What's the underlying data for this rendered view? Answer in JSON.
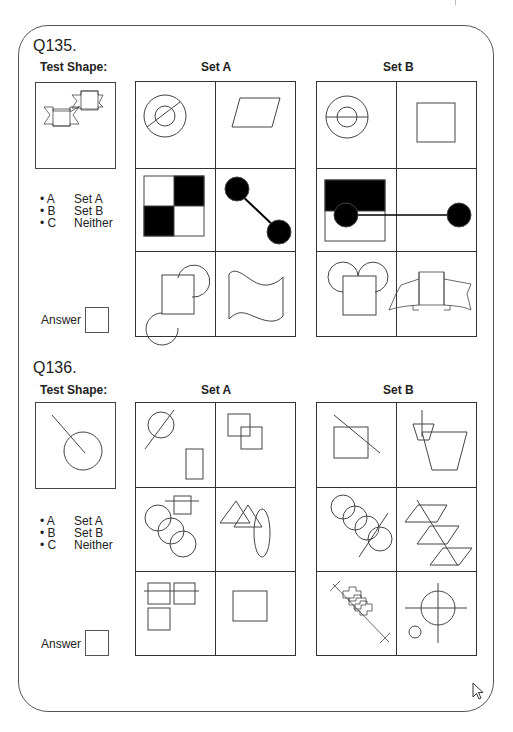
{
  "questions": [
    {
      "id": "Q135.",
      "test_shape_label": "Test Shape:",
      "set_a_label": "Set A",
      "set_b_label": "Set B",
      "test_shape": "two overlapping banner ribbons",
      "set_a_cells": [
        "concentric circles with diagonal line",
        "parallelogram",
        "checkerboard 2x2 square",
        "two filled circles joined by diagonal line",
        "square with two half-circles at opposite corners",
        "wavy flag"
      ],
      "set_b_cells": [
        "concentric circles with horizontal line",
        "square",
        "rectangle half black top",
        "two filled circles joined by horizontal line",
        "square with two circles on top",
        "banner ribbon"
      ],
      "options": [
        {
          "key": "• A",
          "value": "Set A"
        },
        {
          "key": "• B",
          "value": "Set B"
        },
        {
          "key": "• C",
          "value": "Neither"
        }
      ],
      "answer_label": "Answer",
      "answer_value": ""
    },
    {
      "id": "Q136.",
      "test_shape_label": "Test Shape:",
      "set_a_label": "Set A",
      "set_b_label": "Set B",
      "test_shape": "circle with line entering to its center",
      "set_a_cells": [
        "circle crossed by line and rectangle",
        "two overlapping squares",
        "three overlapping circles and square crossed by line",
        "two overlapping triangles and ellipse",
        "three squares crossed by line",
        "rectangle"
      ],
      "set_b_cells": [
        "square crossed by diagonal line",
        "two trapezoids crossed by vertical line",
        "four overlapping circles crossed by line",
        "three parallelograms crossed by line",
        "stacked crosses crossed by line",
        "circle with crosshair and small circle"
      ],
      "options": [
        {
          "key": "• A",
          "value": "Set A"
        },
        {
          "key": "• B",
          "value": "Set B"
        },
        {
          "key": "• C",
          "value": "Neither"
        }
      ],
      "answer_label": "Answer",
      "answer_value": ""
    }
  ],
  "cursor": "arrow-cursor-icon",
  "colors": {
    "line": "#444444",
    "fill": "#000000",
    "background": "#ffffff"
  }
}
